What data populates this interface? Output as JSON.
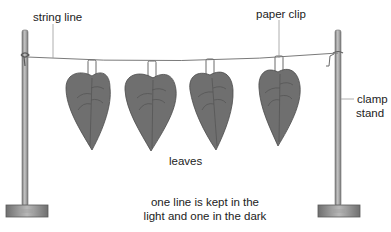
{
  "diagram": {
    "title": "",
    "labels": {
      "string_line": "string line",
      "paper_clip": "paper clip",
      "clamp_stand_line1": "clamp",
      "clamp_stand_line2": "stand",
      "leaves": "leaves"
    },
    "caption": {
      "line1": "one line is kept in the",
      "line2": "light and one in the dark"
    },
    "components": [
      {
        "id": "left-clamp-stand",
        "type": "clamp stand"
      },
      {
        "id": "right-clamp-stand",
        "type": "clamp stand"
      },
      {
        "id": "string-line",
        "type": "string line"
      },
      {
        "id": "leaf-1",
        "type": "leaf",
        "attached_by": "paper clip"
      },
      {
        "id": "leaf-2",
        "type": "leaf",
        "attached_by": "paper clip"
      },
      {
        "id": "leaf-3",
        "type": "leaf",
        "attached_by": "paper clip"
      },
      {
        "id": "leaf-4",
        "type": "leaf",
        "attached_by": "paper clip"
      }
    ],
    "colors": {
      "leaf_fill": "#6f6f6f",
      "leaf_outline": "#4a4a4a",
      "leaf_vein": "#555555",
      "pole": "#9a9a9a",
      "pole_dark": "#6e6e6e",
      "base": "#8c8c8c",
      "string": "#7a7a7a",
      "leader": "#999999",
      "text": "#222222"
    }
  }
}
